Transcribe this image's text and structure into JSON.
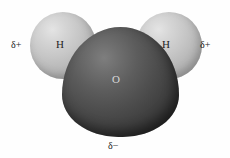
{
  "figure": {
    "background_color": "#fefefe"
  },
  "atoms": [
    {
      "id": "oxygen",
      "symbol": "O",
      "role": "central-atom",
      "color": "#4c4c4c",
      "label_color": "#d8d8d8",
      "highlight_color": "#7e7e7e",
      "shape": "large-sphere"
    },
    {
      "id": "hydrogen-left",
      "symbol": "H",
      "role": "bonded-atom",
      "color": "#c6c6c6",
      "label_color": "#242424",
      "highlight_color": "#e4e4e4",
      "shape": "small-sphere"
    },
    {
      "id": "hydrogen-right",
      "symbol": "H",
      "role": "bonded-atom",
      "color": "#c6c6c6",
      "label_color": "#242424",
      "highlight_color": "#e4e4e4",
      "shape": "small-sphere"
    }
  ],
  "charges": {
    "left": "δ+",
    "right": "δ+",
    "bottom": "δ−",
    "text_color": "#1d1d1d"
  }
}
